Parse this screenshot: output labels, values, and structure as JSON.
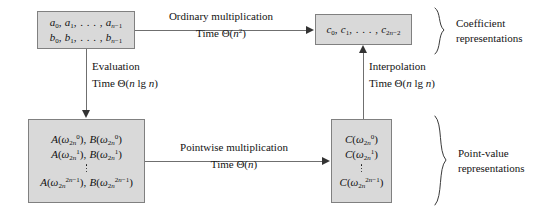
{
  "boxes": {
    "coeff_ab": {
      "name": "coefficient-representation-ab",
      "rows": [
        "a0, a1, . . . , an-1",
        "b0, b1, . . . , bn-1"
      ]
    },
    "coeff_c": {
      "name": "coefficient-representation-c",
      "rows": [
        "c0, c1, . . . , c2n-2"
      ]
    },
    "pointvalue_ab": {
      "name": "point-value-representation-ab",
      "rows": [
        "A(w2n^0), B(w2n^0)",
        "A(w2n^1), B(w2n^1)",
        "vdots",
        "A(w2n^2n-1), B(w2n^2n-1)"
      ]
    },
    "pointvalue_c": {
      "name": "point-value-representation-c",
      "rows": [
        "C(w2n^0)",
        "C(w2n^1)",
        "vdots",
        "C(w2n^2n-1)"
      ]
    }
  },
  "edges": {
    "ordinary_multiplication": {
      "label": "Ordinary multiplication",
      "time": "Time Θ(n2)",
      "time_prefix": "Time Θ(",
      "time_var": "n",
      "time_exp": "2",
      "time_suffix": ")"
    },
    "evaluation": {
      "label": "Evaluation",
      "time_prefix": "Time Θ(",
      "time_var": "n",
      "time_mid": " lg ",
      "time_var2": "n",
      "time_suffix": ")"
    },
    "pointwise_multiplication": {
      "label": "Pointwise multiplication",
      "time_prefix": "Time Θ(",
      "time_var": "n",
      "time_suffix": ")"
    },
    "interpolation": {
      "label": "Interpolation",
      "time_prefix": "Time Θ(",
      "time_var": "n",
      "time_mid": " lg ",
      "time_var2": "n",
      "time_suffix": ")"
    }
  },
  "braces": {
    "coefficient": {
      "line1": "Coefficient",
      "line2": "representations"
    },
    "point_value": {
      "line1": "Point-value",
      "line2": "representations"
    }
  },
  "symbols": {
    "omega": "ω",
    "theta": "Θ",
    "ellipsis": ". . . ,"
  },
  "colors": {
    "box_fill": "#d9d9d9",
    "box_border": "#808080",
    "line": "#6f6f6f",
    "arrow_head": "#333333",
    "text": "#141414",
    "background": "#ffffff"
  }
}
